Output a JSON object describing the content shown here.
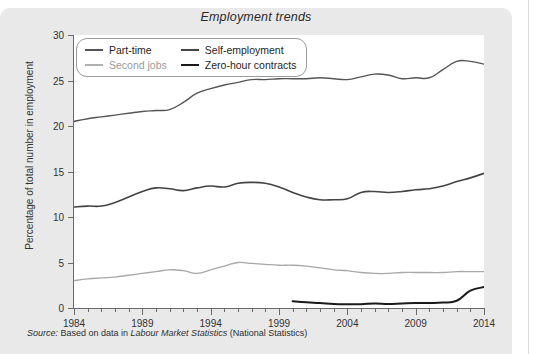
{
  "page": {
    "panel_bg": "#e9e9e9",
    "plot_bg": "#ffffff"
  },
  "source": {
    "prefix": "Source:",
    "text_before": " Based on data in ",
    "italic_title": "Labour Market Statistics",
    "text_after": " (National Statistics)"
  },
  "chart_data": {
    "type": "line",
    "title": "Employment trends",
    "xlabel": "",
    "ylabel": "Percentage of total number in employment",
    "xlim": [
      1984,
      2014
    ],
    "ylim": [
      0,
      30
    ],
    "ytick_labels": [
      "0",
      "5",
      "10",
      "15",
      "20",
      "25",
      "30"
    ],
    "ytick_values": [
      0,
      5,
      10,
      15,
      20,
      25,
      30
    ],
    "xtick_labels": [
      "1984",
      "1989",
      "1994",
      "1999",
      "2004",
      "2009",
      "2014"
    ],
    "xtick_values": [
      1984,
      1989,
      1994,
      1999,
      2004,
      2009,
      2014
    ],
    "minor_xticks_every": 1,
    "grid": false,
    "legend_position": "upper-left-inside",
    "series": [
      {
        "name": "Part-time",
        "color": "#555555",
        "width": 1.4,
        "x": [
          1984,
          1985,
          1986,
          1987,
          1988,
          1989,
          1990,
          1991,
          1992,
          1993,
          1994,
          1995,
          1996,
          1997,
          1998,
          1999,
          2000,
          2001,
          2002,
          2003,
          2004,
          2005,
          2006,
          2007,
          2008,
          2009,
          2010,
          2011,
          2012,
          2013,
          2014
        ],
        "values": [
          20.5,
          20.8,
          21.0,
          21.2,
          21.4,
          21.6,
          21.7,
          21.8,
          22.6,
          23.6,
          24.1,
          24.5,
          24.8,
          25.1,
          25.1,
          25.2,
          25.2,
          25.2,
          25.3,
          25.2,
          25.1,
          25.4,
          25.7,
          25.6,
          25.2,
          25.3,
          25.3,
          26.2,
          27.1,
          27.1,
          26.8
        ],
        "label_y_start": 20.5,
        "label_y_end": 26.8
      },
      {
        "name": "Self-employment",
        "color": "#444444",
        "width": 1.6,
        "x": [
          1984,
          1985,
          1986,
          1987,
          1988,
          1989,
          1990,
          1991,
          1992,
          1993,
          1994,
          1995,
          1996,
          1997,
          1998,
          1999,
          2000,
          2001,
          2002,
          2003,
          2004,
          2005,
          2006,
          2007,
          2008,
          2009,
          2010,
          2011,
          2012,
          2013,
          2014
        ],
        "values": [
          11.1,
          11.2,
          11.2,
          11.6,
          12.2,
          12.8,
          13.2,
          13.1,
          12.9,
          13.2,
          13.4,
          13.3,
          13.7,
          13.8,
          13.7,
          13.3,
          12.7,
          12.2,
          11.9,
          11.9,
          12.0,
          12.7,
          12.8,
          12.7,
          12.8,
          13.0,
          13.1,
          13.4,
          13.9,
          14.3,
          14.8
        ],
        "label_y_start": 11.1,
        "label_y_end": 14.8
      },
      {
        "name": "Second jobs",
        "color": "#a8a8a8",
        "width": 1.3,
        "x": [
          1984,
          1985,
          1986,
          1987,
          1988,
          1989,
          1990,
          1991,
          1992,
          1993,
          1994,
          1995,
          1996,
          1997,
          1998,
          1999,
          2000,
          2001,
          2002,
          2003,
          2004,
          2005,
          2006,
          2007,
          2008,
          2009,
          2010,
          2011,
          2012,
          2013,
          2014
        ],
        "values": [
          3.0,
          3.2,
          3.3,
          3.4,
          3.6,
          3.8,
          4.0,
          4.2,
          4.1,
          3.8,
          4.2,
          4.6,
          5.0,
          4.9,
          4.8,
          4.7,
          4.7,
          4.6,
          4.4,
          4.2,
          4.1,
          3.9,
          3.8,
          3.8,
          3.9,
          3.9,
          3.9,
          3.9,
          4.0,
          4.0,
          4.0
        ],
        "label_y_start": 3.0,
        "label_y_end": 4.0
      },
      {
        "name": "Zero-hour contracts",
        "color": "#1a1a1a",
        "width": 2.0,
        "x": [
          2000,
          2001,
          2002,
          2003,
          2004,
          2005,
          2006,
          2007,
          2008,
          2009,
          2010,
          2011,
          2012,
          2013,
          2014
        ],
        "values": [
          0.75,
          0.62,
          0.55,
          0.45,
          0.42,
          0.42,
          0.5,
          0.45,
          0.5,
          0.55,
          0.55,
          0.6,
          0.8,
          1.9,
          2.3
        ],
        "label_y_start": 0.75,
        "label_y_end": 2.3
      }
    ],
    "legend": [
      {
        "label": "Part-time",
        "color": "#555555",
        "text_color": "#1f1f1f"
      },
      {
        "label": "Self-employment",
        "color": "#444444",
        "text_color": "#1f1f1f"
      },
      {
        "label": "Second jobs",
        "color": "#b0b0b0",
        "text_color": "#9a9a9a"
      },
      {
        "label": "Zero-hour contracts",
        "color": "#1a1a1a",
        "text_color": "#1f1f1f"
      }
    ]
  }
}
